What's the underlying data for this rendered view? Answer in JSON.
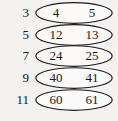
{
  "figure": {
    "type": "number-pair-diagram",
    "background_color": "#f3f2f0",
    "ink_color": "#18161a",
    "row_count": 5,
    "oval_shape": "ellipse"
  },
  "rows": [
    {
      "label": "3",
      "left_value": "4",
      "right_value": "5"
    },
    {
      "label": "5",
      "left_value": "12",
      "right_value": "13"
    },
    {
      "label": "7",
      "left_value": "24",
      "right_value": "25"
    },
    {
      "label": "9",
      "left_value": "40",
      "right_value": "41"
    },
    {
      "label": "11",
      "left_value": "60",
      "right_value": "61"
    }
  ],
  "chart_data": {
    "type": "table",
    "title": "",
    "columns": [
      "n",
      "pair_lower",
      "pair_upper"
    ],
    "rows": [
      [
        "3",
        "4",
        "5"
      ],
      [
        "5",
        "12",
        "13"
      ],
      [
        "7",
        "24",
        "25"
      ],
      [
        "9",
        "40",
        "41"
      ],
      [
        "11",
        "60",
        "61"
      ]
    ],
    "xlabel": "",
    "ylabel": "",
    "grid": false,
    "legend": false
  }
}
